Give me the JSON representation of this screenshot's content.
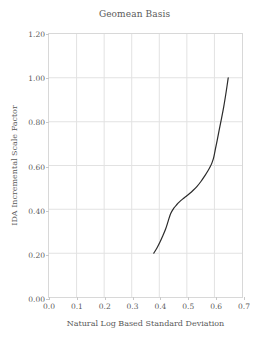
{
  "chart_data": {
    "type": "line",
    "title": "Geomean Basis",
    "xlabel": "Natural Log Based Standard Deviation",
    "ylabel": "IDA Incremental Scale Factor",
    "xlim": [
      0.0,
      0.7
    ],
    "ylim": [
      0.0,
      1.2
    ],
    "grid": true,
    "legend": null,
    "xticks": [
      0.0,
      0.1,
      0.2,
      0.3,
      0.4,
      0.5,
      0.6,
      0.7
    ],
    "xtick_labels": [
      "0.0",
      "0.1",
      "0.2",
      "0.3",
      "0.4",
      "0.5",
      "0.6",
      "0.7"
    ],
    "yticks": [
      0.0,
      0.2,
      0.4,
      0.6,
      0.8,
      1.0,
      1.2
    ],
    "ytick_labels": [
      "0.00",
      "0.20",
      "0.40",
      "0.60",
      "0.80",
      "1.00",
      "1.20"
    ],
    "series": [
      {
        "name": "Geomean Basis",
        "color": "#2b2b2b",
        "x": [
          0.38,
          0.392,
          0.403,
          0.413,
          0.423,
          0.432,
          0.441,
          0.452,
          0.463,
          0.474,
          0.486,
          0.498,
          0.51,
          0.523,
          0.537,
          0.551,
          0.565,
          0.576,
          0.585,
          0.591,
          0.596,
          0.6,
          0.604,
          0.61,
          0.617,
          0.625,
          0.634,
          0.643,
          0.65
        ],
        "y": [
          0.2,
          0.225,
          0.252,
          0.28,
          0.31,
          0.345,
          0.38,
          0.404,
          0.421,
          0.435,
          0.448,
          0.46,
          0.472,
          0.487,
          0.505,
          0.527,
          0.553,
          0.575,
          0.595,
          0.612,
          0.63,
          0.652,
          0.678,
          0.715,
          0.76,
          0.81,
          0.87,
          0.94,
          1.0
        ]
      }
    ]
  }
}
